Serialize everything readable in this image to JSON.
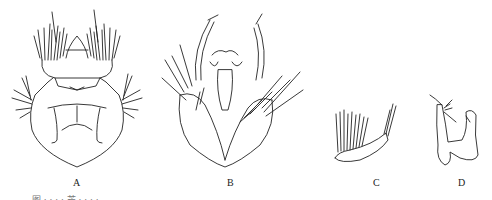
{
  "figure": {
    "panels": [
      {
        "id": "A",
        "label": "A",
        "subject": "dorsal view with setae tufts"
      },
      {
        "id": "B",
        "label": "B",
        "subject": "genital structure with appendages"
      },
      {
        "id": "C",
        "label": "C",
        "subject": "appendage with setae comb"
      },
      {
        "id": "D",
        "label": "D",
        "subject": "clasper appendage"
      }
    ],
    "caption": "图 · · · · 芒 · · · ·"
  }
}
